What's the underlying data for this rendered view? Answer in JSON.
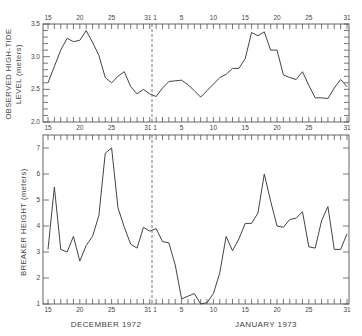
{
  "chart_data": [
    {
      "type": "line",
      "panel": "top",
      "ylabel_line1": "OBSERVED  HIGH-TIDE",
      "ylabel_line2": "LEVEL (meters)",
      "ylim": [
        2.0,
        3.5
      ],
      "yticks": [
        "2.0",
        "2.5",
        "3.0",
        "3.5"
      ],
      "ytick_values": [
        2.0,
        2.5,
        3.0,
        3.5
      ],
      "x_tick_labels": [
        "15",
        "20",
        "25",
        "31",
        "1",
        "5",
        "10",
        "15",
        "20",
        "25",
        "31"
      ],
      "x_tick_days": [
        0,
        5,
        10,
        16,
        17,
        21,
        26,
        31,
        36,
        41,
        47
      ],
      "x_day_count": 48,
      "series": [
        {
          "name": "Observed high-tide level",
          "values": [
            2.6,
            2.85,
            3.1,
            3.28,
            3.23,
            3.25,
            3.4,
            3.22,
            3.02,
            2.68,
            2.6,
            2.7,
            2.77,
            2.54,
            2.43,
            2.5,
            2.43,
            2.39,
            2.52,
            2.62,
            2.63,
            2.64,
            2.57,
            2.48,
            2.38,
            2.48,
            2.58,
            2.68,
            2.73,
            2.82,
            2.82,
            2.97,
            3.37,
            3.32,
            3.38,
            3.1,
            3.1,
            2.72,
            2.68,
            2.65,
            2.77,
            2.56,
            2.37,
            2.37,
            2.36,
            2.52,
            2.65,
            2.54
          ]
        }
      ]
    },
    {
      "type": "line",
      "panel": "bottom",
      "ylabel": "BREAKER HEIGHT (meters)",
      "ylim": [
        1,
        7.5
      ],
      "yticks": [
        "1",
        "2",
        "3",
        "4",
        "5",
        "6",
        "7"
      ],
      "ytick_values": [
        1,
        2,
        3,
        4,
        5,
        6,
        7
      ],
      "x_tick_labels": [
        "15",
        "20",
        "25",
        "31",
        "1",
        "5",
        "10",
        "15",
        "20",
        "25",
        "31"
      ],
      "x_tick_days": [
        0,
        5,
        10,
        16,
        17,
        21,
        26,
        31,
        36,
        41,
        47
      ],
      "x_day_count": 48,
      "xlabel_left": "DECEMBER 1972",
      "xlabel_right": "JANUARY 1973",
      "series": [
        {
          "name": "Breaker height",
          "values": [
            3.1,
            5.5,
            3.1,
            3.0,
            3.6,
            2.65,
            3.25,
            3.6,
            4.4,
            6.8,
            7.0,
            4.7,
            3.95,
            3.3,
            3.15,
            3.95,
            3.8,
            3.9,
            3.4,
            3.35,
            2.5,
            1.2,
            1.3,
            1.4,
            1.0,
            1.05,
            1.4,
            2.2,
            3.6,
            3.05,
            3.5,
            4.1,
            4.1,
            4.5,
            6.0,
            4.95,
            4.0,
            3.95,
            4.25,
            4.3,
            4.55,
            3.2,
            3.15,
            4.2,
            4.75,
            3.1,
            3.1,
            3.7
          ]
        }
      ]
    }
  ]
}
